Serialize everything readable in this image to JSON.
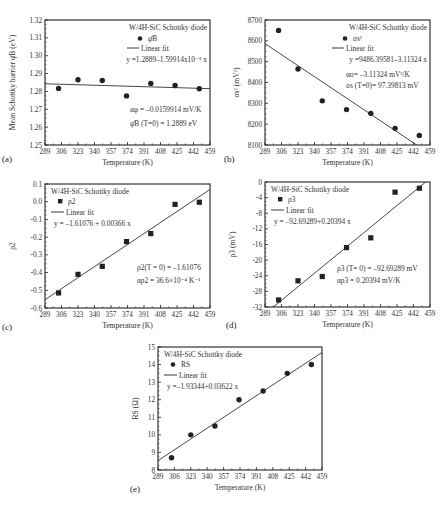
{
  "figure": {
    "panels": [
      {
        "tag": "(a)",
        "legend_title": "W/4H-SiC Schottky diode",
        "legend_series": "φ̄B",
        "legend_fit": "Linear fit",
        "equation": "y =1.2889–1.59914x10⁻⁵ x",
        "annotations": [
          "αφ = –0.0159914 mV/K",
          "φ̄B (T=0) = 1.2889 eV"
        ]
      },
      {
        "tag": "(b)",
        "legend_title": "W/4H-SiC Schottky diode",
        "legend_series": "σs²",
        "legend_fit": "Linear fit",
        "equation": "y =9486.39581–3.11324 x",
        "annotations": [
          "ασ= –3.11324 mV²/K",
          "σs (T=0)= 97.39813 mV"
        ]
      },
      {
        "tag": "(c)",
        "legend_title": "W/4H-SiC Schottky diode",
        "legend_series": "ρ2",
        "legend_fit": "Linear fit",
        "equation": "y = –1.61076 + 0.00366 x",
        "annotations": [
          "ρ2(T = 0) = –1.61076",
          "αρ2 = 36.6×10⁻⁴ K⁻¹"
        ]
      },
      {
        "tag": "(d)",
        "legend_title": "W/4H-SiC Schottky diode",
        "legend_series": "ρ3",
        "legend_fit": "Linear fit",
        "equation": "y = –92.69289+0.20394 x",
        "annotations": [
          "ρ3 (T= 0) = –92.69289 mV",
          "αρ3 = 0.20394 mV/K"
        ]
      },
      {
        "tag": "(e)",
        "legend_title": "W/4H-SiC Schottky diode",
        "legend_series": "RS",
        "legend_fit": "Linear fit",
        "equation": "y =–1.93344+0.03622 x",
        "annotations": []
      }
    ]
  },
  "chart_data": [
    {
      "type": "scatter",
      "title": "(a)",
      "xlabel": "Temperature (K)",
      "ylabel": "Mean Schottky barrier φ̄B (eV)",
      "xlim": [
        289,
        459
      ],
      "ylim": [
        1.25,
        1.32
      ],
      "xticks": [
        289,
        306,
        323,
        340,
        357,
        374,
        391,
        408,
        425,
        442,
        459
      ],
      "yticks": [
        1.25,
        1.26,
        1.27,
        1.28,
        1.29,
        1.3,
        1.31,
        1.32
      ],
      "ytick_labels": [
        "1.25",
        "1.26",
        "1.27",
        "1.28",
        "1.29",
        "1.30",
        "1.31",
        "1.32"
      ],
      "marker": "circle",
      "series": [
        {
          "name": "φ̄B",
          "x": [
            303,
            323,
            348,
            373,
            398,
            423,
            448
          ],
          "y": [
            1.2817,
            1.2865,
            1.2861,
            1.2775,
            1.2845,
            1.2833,
            1.2815
          ]
        },
        {
          "name": "Linear fit",
          "fit": {
            "intercept": 1.2889,
            "slope": -1.59914e-05
          }
        }
      ],
      "legend": [
        "W/4H-SiC Schottky diode",
        "φ̄B",
        "Linear fit"
      ],
      "grid": false
    },
    {
      "type": "scatter",
      "title": "(b)",
      "xlabel": "Temperature (K)",
      "ylabel": "σs² (mV²)",
      "xlim": [
        289,
        459
      ],
      "ylim": [
        8100,
        8700
      ],
      "xticks": [
        289,
        306,
        323,
        340,
        357,
        374,
        391,
        408,
        425,
        442,
        459
      ],
      "yticks": [
        8100,
        8200,
        8300,
        8400,
        8500,
        8600,
        8700
      ],
      "ytick_labels": [
        "8100",
        "8200",
        "8300",
        "8400",
        "8500",
        "8600",
        "8700"
      ],
      "marker": "circle",
      "series": [
        {
          "name": "σs²",
          "x": [
            303,
            323,
            348,
            373,
            398,
            423,
            448
          ],
          "y": [
            8650,
            8465,
            8312,
            8270,
            8252,
            8180,
            8146
          ]
        },
        {
          "name": "Linear fit",
          "fit": {
            "intercept": 9486.39581,
            "slope": -3.11324
          }
        }
      ],
      "legend": [
        "W/4H-SiC Schottky diode",
        "σs²",
        "Linear fit"
      ],
      "grid": false
    },
    {
      "type": "scatter",
      "title": "(c)",
      "xlabel": "Temperature (K)",
      "ylabel": "ρ2",
      "xlim": [
        289,
        459
      ],
      "ylim": [
        -0.6,
        0.1
      ],
      "xticks": [
        289,
        306,
        323,
        340,
        357,
        374,
        391,
        408,
        425,
        442,
        459
      ],
      "yticks": [
        -0.6,
        -0.5,
        -0.4,
        -0.3,
        -0.2,
        -0.1,
        0.0,
        0.1
      ],
      "ytick_labels": [
        "-0.6",
        "-0.5",
        "-0.4",
        "-0.3",
        "-0.2",
        "-0.1",
        "0.0",
        "0.1"
      ],
      "marker": "square",
      "series": [
        {
          "name": "ρ2",
          "x": [
            303,
            323,
            348,
            373,
            398,
            423,
            448
          ],
          "y": [
            -0.515,
            -0.41,
            -0.365,
            -0.225,
            -0.18,
            -0.015,
            -0.003
          ]
        },
        {
          "name": "Linear fit",
          "fit": {
            "intercept": -1.61076,
            "slope": 0.00366
          }
        }
      ],
      "legend": [
        "W/4H-SiC Schottky diode",
        "ρ2",
        "Linear fit"
      ],
      "grid": false
    },
    {
      "type": "scatter",
      "title": "(d)",
      "xlabel": "Temperature (K)",
      "ylabel": "ρ3 (mV)",
      "xlim": [
        289,
        459
      ],
      "ylim": [
        -32,
        0
      ],
      "xticks": [
        289,
        306,
        323,
        340,
        357,
        374,
        391,
        408,
        425,
        442,
        459
      ],
      "yticks": [
        -32,
        -28,
        -24,
        -20,
        -16,
        -12,
        -8,
        -4,
        0
      ],
      "ytick_labels": [
        "-32",
        "-28",
        "-24",
        "-20",
        "-16",
        "-12",
        "-8",
        "-4",
        "0"
      ],
      "marker": "square",
      "series": [
        {
          "name": "ρ3",
          "x": [
            303,
            323,
            348,
            373,
            398,
            423,
            448
          ],
          "y": [
            -30.2,
            -25.3,
            -24.2,
            -16.8,
            -14.3,
            -2.6,
            -1.6
          ]
        },
        {
          "name": "Linear fit",
          "fit": {
            "intercept": -92.69289,
            "slope": 0.20394
          }
        }
      ],
      "legend": [
        "W/4H-SiC Schottky diode",
        "ρ3",
        "Linear fit"
      ],
      "grid": false
    },
    {
      "type": "scatter",
      "title": "(e)",
      "xlabel": "Temperature (K)",
      "ylabel": "RS (Ω)",
      "xlim": [
        289,
        459
      ],
      "ylim": [
        8,
        15
      ],
      "xticks": [
        289,
        306,
        323,
        340,
        357,
        374,
        391,
        408,
        425,
        442,
        459
      ],
      "yticks": [
        8,
        9,
        10,
        11,
        12,
        13,
        14,
        15
      ],
      "ytick_labels": [
        "8",
        "9",
        "10",
        "11",
        "12",
        "13",
        "14",
        "15"
      ],
      "marker": "circle",
      "series": [
        {
          "name": "RS",
          "x": [
            303,
            323,
            348,
            373,
            398,
            423,
            448
          ],
          "y": [
            8.7,
            10.0,
            10.5,
            12.0,
            12.5,
            13.5,
            14.0
          ]
        },
        {
          "name": "Linear fit",
          "fit": {
            "intercept": -1.93344,
            "slope": 0.03622
          }
        }
      ],
      "legend": [
        "W/4H-SiC Schottky diode",
        "RS",
        "Linear fit"
      ],
      "grid": false
    }
  ]
}
